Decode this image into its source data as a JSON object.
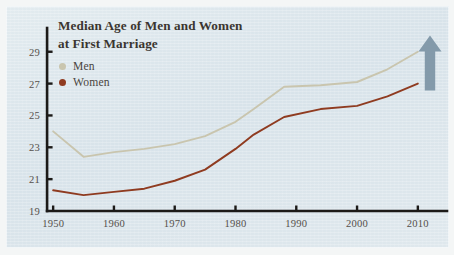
{
  "chart_data": {
    "type": "line",
    "title": "Median Age of Men and Women at First Marriage",
    "title_line1": "Median Age of Men and Women",
    "title_line2": "at First Marriage",
    "xlabel": "",
    "ylabel": "",
    "xlim": [
      1948,
      2012
    ],
    "ylim": [
      19,
      29.8
    ],
    "grid": false,
    "legend_position": "top-left",
    "xticks": [
      1950,
      1960,
      1970,
      1980,
      1990,
      2000,
      2010
    ],
    "yticks": [
      19,
      21,
      23,
      25,
      27,
      29
    ],
    "series": [
      {
        "name": "Men",
        "color": "#c9c5ae",
        "x": [
          1950,
          1955,
          1960,
          1965,
          1970,
          1975,
          1980,
          1983,
          1988,
          1994,
          2000,
          2005,
          2010
        ],
        "values": [
          24.0,
          22.4,
          22.7,
          22.9,
          23.2,
          23.7,
          24.6,
          25.4,
          26.8,
          26.9,
          27.1,
          27.9,
          29.0
        ]
      },
      {
        "name": "Women",
        "color": "#8f3b20",
        "x": [
          1950,
          1955,
          1960,
          1965,
          1970,
          1975,
          1980,
          1983,
          1988,
          1994,
          2000,
          2005,
          2010
        ],
        "values": [
          20.3,
          20.0,
          20.2,
          20.4,
          20.9,
          21.6,
          22.9,
          23.8,
          24.9,
          25.4,
          25.6,
          26.2,
          27.0
        ]
      }
    ],
    "annotations": [
      {
        "name": "up-arrow",
        "type": "arrow",
        "direction": "up",
        "color": "#7e96a6",
        "x": 2012,
        "y": 28.2
      }
    ]
  },
  "axis": {
    "color": "#1c1a18",
    "tick_color": "#1c1a18"
  },
  "panel": {
    "background": "#dde7ec"
  }
}
